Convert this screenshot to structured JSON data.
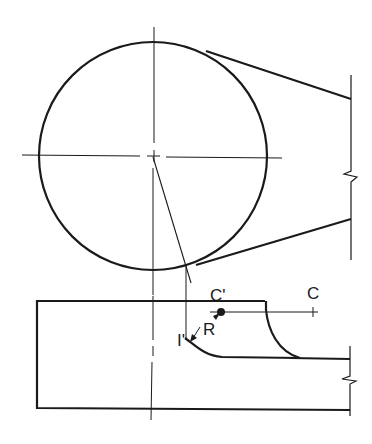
{
  "figure": {
    "stroke_color": "#1a1a1a",
    "background": "#ffffff"
  },
  "labels": {
    "c_prime": "C'",
    "c": "C",
    "r": "R",
    "i_prime": "I'"
  },
  "points": {
    "circle_center": [
      153,
      156
    ],
    "c_prime": [
      221,
      312
    ],
    "c": [
      313,
      312
    ]
  }
}
